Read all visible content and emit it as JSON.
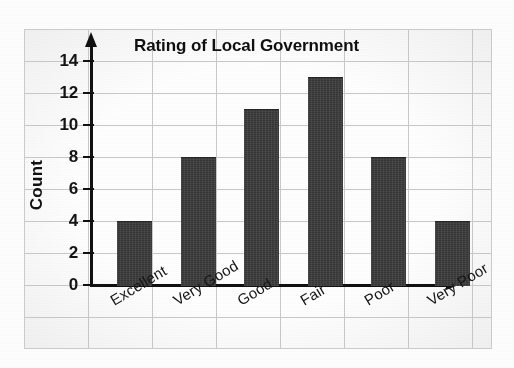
{
  "chart_data": {
    "type": "bar",
    "title": "Rating of Local Government",
    "xlabel": "",
    "ylabel": "Count",
    "categories": [
      "Excellent",
      "Very Good",
      "Good",
      "Fair",
      "Poor",
      "Very Poor"
    ],
    "values": [
      4,
      8,
      11,
      13,
      8,
      4
    ],
    "series": [
      {
        "name": "Count",
        "values": [
          4,
          8,
          11,
          13,
          8,
          4
        ]
      }
    ],
    "ylim": [
      0,
      14
    ],
    "ytick_values": [
      0,
      2,
      4,
      6,
      8,
      10,
      12,
      14
    ],
    "ytick_labels": [
      "0",
      "2",
      "4",
      "6",
      "8",
      "10",
      "12",
      "14"
    ],
    "grid": true,
    "grid_style": "graph-paper",
    "legend": false,
    "legend_position": "none",
    "bar_color": "#3b3b3b",
    "axis_color": "#111111",
    "grid_color": "#c9c9c9",
    "background_color": "#fefefe",
    "axis_arrows": true,
    "xtick_label_rotation": -31
  },
  "figure": {
    "title": "Rating of Local Government",
    "y_axis_title": "Count"
  }
}
